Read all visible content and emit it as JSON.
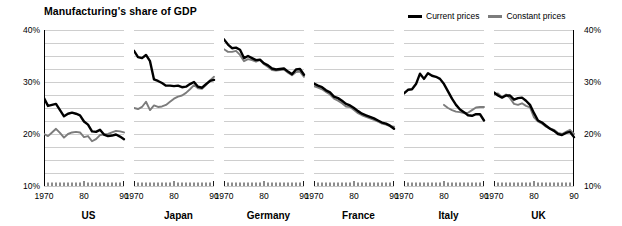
{
  "chart_data": {
    "type": "line",
    "title": "Manufacturing's share of GDP",
    "xlabel": "",
    "ylabel": "",
    "ylim": [
      10,
      40
    ],
    "xlim": [
      1970,
      1990
    ],
    "ytick_labels": [
      "40%",
      "30%",
      "20%",
      "10%"
    ],
    "ytick_values": [
      40,
      30,
      20,
      10
    ],
    "gridline_values": [
      40,
      37.5,
      35,
      32.5,
      30,
      27.5,
      25,
      22.5,
      20,
      17.5,
      15,
      12.5,
      10
    ],
    "grid": true,
    "grid_color": "#c8c8c8",
    "right_axis_labels": [
      "40%",
      "30%",
      "20%",
      "10%"
    ],
    "xtick_labels": [
      "1970",
      "80",
      "90"
    ],
    "xtick_label_values": [
      1970,
      1980,
      1990
    ],
    "x_minor_ticks": [
      1970,
      1971,
      1972,
      1973,
      1974,
      1975,
      1976,
      1977,
      1978,
      1979,
      1980,
      1981,
      1982,
      1983,
      1984,
      1985,
      1986,
      1987,
      1988,
      1989,
      1990
    ],
    "legend": {
      "position": "top-right",
      "entries": [
        {
          "name": "Current prices",
          "color": "#000000"
        },
        {
          "name": "Constant prices",
          "color": "#7c7c7c"
        }
      ]
    },
    "x": [
      1970,
      1971,
      1972,
      1973,
      1974,
      1975,
      1976,
      1977,
      1978,
      1979,
      1980,
      1981,
      1982,
      1983,
      1984,
      1985,
      1986,
      1987,
      1988,
      1989,
      1990
    ],
    "panels": [
      {
        "name": "US",
        "series": [
          {
            "name": "Current prices",
            "color": "#000000",
            "values": [
              26.9,
              25.4,
              25.6,
              25.8,
              24.6,
              23.4,
              23.9,
              24.1,
              23.9,
              23.6,
              22.4,
              21.8,
              20.5,
              20.4,
              20.8,
              19.9,
              19.6,
              19.7,
              19.9,
              19.5,
              19.0
            ]
          },
          {
            "name": "Constant prices",
            "color": "#7c7c7c",
            "values": [
              20.0,
              19.6,
              20.3,
              21.0,
              20.2,
              19.3,
              20.0,
              20.3,
              20.4,
              20.3,
              19.4,
              19.6,
              18.6,
              19.0,
              19.8,
              19.9,
              20.0,
              20.3,
              20.6,
              20.5,
              20.3
            ]
          }
        ]
      },
      {
        "name": "Japan",
        "series": [
          {
            "name": "Current prices",
            "color": "#000000",
            "values": [
              36.0,
              34.8,
              34.6,
              35.2,
              34.0,
              30.5,
              30.2,
              29.8,
              29.3,
              29.3,
              29.2,
              29.3,
              29.0,
              29.1,
              29.6,
              30.0,
              29.1,
              28.9,
              29.6,
              30.2,
              30.4
            ]
          },
          {
            "name": "Constant prices",
            "color": "#7c7c7c",
            "values": [
              25.0,
              24.8,
              25.2,
              26.2,
              24.6,
              25.5,
              25.2,
              25.3,
              25.6,
              26.2,
              26.8,
              27.2,
              27.4,
              27.9,
              28.6,
              29.4,
              28.8,
              28.7,
              29.4,
              30.3,
              31.0
            ]
          }
        ]
      },
      {
        "name": "Germany",
        "series": [
          {
            "name": "Current prices",
            "color": "#000000",
            "values": [
              38.2,
              37.2,
              36.5,
              36.6,
              36.2,
              34.6,
              35.0,
              34.6,
              34.2,
              34.3,
              33.6,
              33.2,
              32.6,
              32.4,
              32.5,
              32.6,
              32.0,
              31.5,
              32.4,
              32.5,
              31.4
            ]
          },
          {
            "name": "Constant prices",
            "color": "#7c7c7c",
            "values": [
              36.3,
              35.8,
              35.8,
              36.0,
              35.2,
              34.0,
              34.4,
              34.2,
              33.9,
              34.2,
              33.4,
              32.9,
              32.3,
              32.2,
              32.3,
              32.4,
              31.8,
              31.3,
              31.9,
              32.0,
              31.0
            ]
          }
        ]
      },
      {
        "name": "France",
        "series": [
          {
            "name": "Current prices",
            "color": "#000000",
            "values": [
              29.7,
              29.3,
              29.0,
              28.4,
              28.0,
              27.2,
              26.9,
              26.4,
              25.8,
              25.5,
              25.0,
              24.4,
              23.9,
              23.6,
              23.3,
              23.0,
              22.6,
              22.2,
              22.0,
              21.6,
              21.0
            ]
          },
          {
            "name": "Constant prices",
            "color": "#7c7c7c",
            "values": [
              29.2,
              28.9,
              28.6,
              28.1,
              27.6,
              26.8,
              26.4,
              25.9,
              25.3,
              25.2,
              24.6,
              24.0,
              23.6,
              23.3,
              23.0,
              22.7,
              22.4,
              22.0,
              21.8,
              21.5,
              21.4
            ]
          }
        ]
      },
      {
        "name": "Italy",
        "series": [
          {
            "name": "Current prices",
            "color": "#000000",
            "values": [
              27.8,
              28.5,
              28.6,
              29.6,
              31.6,
              30.6,
              31.7,
              31.2,
              31.0,
              30.6,
              29.6,
              28.2,
              26.8,
              25.6,
              24.7,
              24.2,
              23.6,
              23.5,
              23.8,
              23.8,
              22.6
            ]
          },
          {
            "name": "Constant prices",
            "color": "#7c7c7c",
            "values": [
              null,
              null,
              null,
              null,
              null,
              null,
              null,
              null,
              null,
              null,
              25.6,
              25.0,
              24.6,
              24.3,
              24.2,
              24.0,
              24.1,
              24.6,
              25.1,
              25.2,
              25.2
            ]
          }
        ]
      },
      {
        "name": "UK",
        "series": [
          {
            "name": "Current prices",
            "color": "#000000",
            "values": [
              28.0,
              27.4,
              27.0,
              27.4,
              27.4,
              26.6,
              26.9,
              27.0,
              26.4,
              25.6,
              24.0,
              22.6,
              22.2,
              21.6,
              21.0,
              20.6,
              20.0,
              19.8,
              20.2,
              20.4,
              19.4
            ]
          },
          {
            "name": "Constant prices",
            "color": "#7c7c7c",
            "values": [
              27.6,
              27.8,
              27.1,
              27.6,
              26.9,
              25.8,
              25.6,
              25.9,
              25.4,
              25.1,
              23.2,
              22.4,
              22.0,
              21.4,
              21.1,
              20.8,
              20.2,
              20.0,
              20.4,
              20.8,
              20.0
            ]
          }
        ]
      }
    ]
  }
}
